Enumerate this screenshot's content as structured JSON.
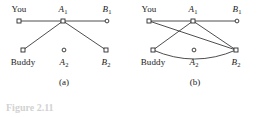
{
  "figure": {
    "background_color": "#ffffff",
    "line_color": "#3a3a3a",
    "node_fill": "#ffffff",
    "node_stroke": "#2b2b2b",
    "clipped_caption": "Figure 2.11"
  },
  "panels": [
    {
      "id": "a",
      "caption": "(a)",
      "caption_x": 64,
      "caption_y": 77,
      "nodes": [
        {
          "name": "you",
          "label": "You",
          "italic": false,
          "sub": "",
          "x": 19,
          "y": 21,
          "label_x": 19,
          "label_y": 4,
          "marker": "square"
        },
        {
          "name": "a1",
          "label": "A",
          "italic": true,
          "sub": "1",
          "x": 63,
          "y": 21,
          "label_x": 63,
          "label_y": 4,
          "marker": "square"
        },
        {
          "name": "b1",
          "label": "B",
          "italic": true,
          "sub": "1",
          "x": 107,
          "y": 21,
          "label_x": 107,
          "label_y": 4,
          "marker": "circle"
        },
        {
          "name": "buddy",
          "label": "Buddy",
          "italic": false,
          "sub": "",
          "x": 23,
          "y": 50,
          "label_x": 23,
          "label_y": 57,
          "marker": "square"
        },
        {
          "name": "a2",
          "label": "A",
          "italic": true,
          "sub": "2",
          "x": 64,
          "y": 50,
          "label_x": 64,
          "label_y": 57,
          "marker": "circle"
        },
        {
          "name": "b2",
          "label": "B",
          "italic": true,
          "sub": "2",
          "x": 106,
          "y": 50,
          "label_x": 106,
          "label_y": 57,
          "marker": "square"
        }
      ],
      "edges": [
        {
          "name": "edge-you-a1",
          "from": "you",
          "to": "a1",
          "curve": 0
        },
        {
          "name": "edge-a1-b1",
          "from": "a1",
          "to": "b1",
          "curve": 0
        },
        {
          "name": "edge-a1-buddy",
          "from": "a1",
          "to": "buddy",
          "curve": 0
        },
        {
          "name": "edge-a1-b2",
          "from": "a1",
          "to": "b2",
          "curve": 0
        }
      ]
    },
    {
      "id": "b",
      "caption": "(b)",
      "caption_x": 66,
      "caption_y": 77,
      "nodes": [
        {
          "name": "you",
          "label": "You",
          "italic": false,
          "sub": "",
          "x": 20,
          "y": 21,
          "label_x": 20,
          "label_y": 4,
          "marker": "square"
        },
        {
          "name": "a1",
          "label": "A",
          "italic": true,
          "sub": "1",
          "x": 64,
          "y": 21,
          "label_x": 64,
          "label_y": 4,
          "marker": "square"
        },
        {
          "name": "b1",
          "label": "B",
          "italic": true,
          "sub": "1",
          "x": 108,
          "y": 21,
          "label_x": 108,
          "label_y": 4,
          "marker": "circle"
        },
        {
          "name": "buddy",
          "label": "Buddy",
          "italic": false,
          "sub": "",
          "x": 24,
          "y": 50,
          "label_x": 24,
          "label_y": 57,
          "marker": "square"
        },
        {
          "name": "a2",
          "label": "A",
          "italic": true,
          "sub": "2",
          "x": 65,
          "y": 50,
          "label_x": 65,
          "label_y": 57,
          "marker": "circle"
        },
        {
          "name": "b2",
          "label": "B",
          "italic": true,
          "sub": "2",
          "x": 107,
          "y": 50,
          "label_x": 107,
          "label_y": 57,
          "marker": "square"
        }
      ],
      "edges": [
        {
          "name": "edge-you-a1",
          "from": "you",
          "to": "a1",
          "curve": 0
        },
        {
          "name": "edge-a1-b1",
          "from": "a1",
          "to": "b1",
          "curve": 0
        },
        {
          "name": "edge-a1-buddy",
          "from": "a1",
          "to": "buddy",
          "curve": 0
        },
        {
          "name": "edge-a1-b2",
          "from": "a1",
          "to": "b2",
          "curve": 0
        },
        {
          "name": "edge-you-b2",
          "from": "you",
          "to": "b2",
          "curve": 0
        },
        {
          "name": "edge-buddy-b2",
          "from": "buddy",
          "to": "b2",
          "curve": 9
        }
      ]
    }
  ]
}
